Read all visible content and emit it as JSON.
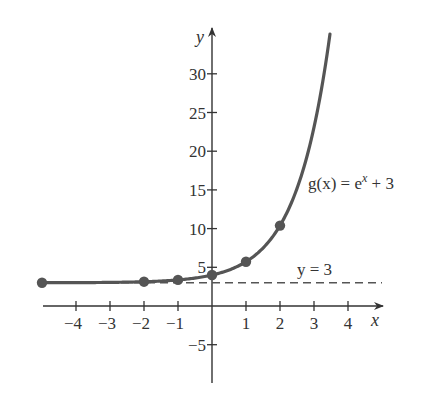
{
  "chart_data": {
    "type": "line",
    "title": "",
    "xlabel": "x",
    "ylabel": "y",
    "xlim": [
      -5,
      4.5
    ],
    "ylim": [
      -10,
      35
    ],
    "grid": false,
    "x_ticks": [
      -4,
      -3,
      -2,
      -1,
      1,
      2,
      3,
      4
    ],
    "x_tick_labels": [
      "−4",
      "−3",
      "−2",
      "−1",
      "1",
      "2",
      "3",
      "4"
    ],
    "y_ticks": [
      -5,
      5,
      10,
      15,
      20,
      25,
      30
    ],
    "y_tick_labels": [
      "−5",
      "5",
      "10",
      "15",
      "20",
      "25",
      "30"
    ],
    "series": [
      {
        "name": "g(x) = e^x + 3",
        "function": "e^x + 3",
        "x_range": [
          -5,
          3.47
        ],
        "color": "#555555",
        "points": [
          {
            "x": -5,
            "y": 3.01
          },
          {
            "x": -2,
            "y": 3.14
          },
          {
            "x": -1,
            "y": 3.37
          },
          {
            "x": 0,
            "y": 4
          },
          {
            "x": 1,
            "y": 5.72
          },
          {
            "x": 2,
            "y": 10.39
          }
        ]
      }
    ],
    "asymptote": {
      "type": "horizontal",
      "y": 3,
      "style": "dashed",
      "label": "y = 3"
    },
    "annotations": [
      {
        "text_main": "g(x) = e",
        "text_sup": "x",
        "text_tail": " + 3",
        "near": "curve"
      },
      {
        "text": "y = 3",
        "near": "asymptote"
      }
    ]
  },
  "labels": {
    "x_axis": "x",
    "y_axis": "y",
    "curve_main": "g(x) = e",
    "curve_sup": "x",
    "curve_tail": " + 3",
    "asymptote": "y = 3"
  }
}
